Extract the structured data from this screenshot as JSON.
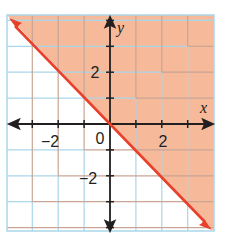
{
  "chart_data": {
    "type": "inequality-graph",
    "title": "",
    "xlabel": "x",
    "ylabel": "y",
    "xlim": [
      -4,
      4
    ],
    "ylim": [
      -4.2,
      4
    ],
    "grid": true,
    "x_tick_labels": [
      {
        "value": -2,
        "text": "−2"
      },
      {
        "value": 2,
        "text": "2"
      }
    ],
    "y_tick_labels": [
      {
        "value": 2,
        "text": "2"
      },
      {
        "value": -2,
        "text": "−2"
      }
    ],
    "origin_label": "0",
    "boundary_line": {
      "equation": "y = -x",
      "slope": -1,
      "intercept": 0,
      "style": "solid",
      "arrows": "both"
    },
    "shaded_region": "above line (y >= -x)",
    "colors": {
      "shade": "#f6b99a",
      "boundary": "#e8402a",
      "grid_unshaded": "#a9d6ea",
      "grid_shaded": "#c9a594",
      "axes": "#231f20"
    }
  }
}
